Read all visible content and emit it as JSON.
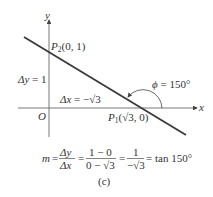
{
  "figure": {
    "caption": "(c)",
    "axes": {
      "x_label": "x",
      "y_label": "y",
      "origin_label": "O"
    },
    "points": {
      "p2": {
        "name": "P",
        "sub": "2",
        "coords": "(0, 1)"
      },
      "p1": {
        "name": "P",
        "sub": "1",
        "coords_prefix": "(",
        "sqrt": "√3",
        "coords_suffix": ", 0)"
      }
    },
    "delta_y": {
      "label": "Δy",
      "eq": " = 1"
    },
    "delta_x": {
      "label": "Δx",
      "eq": " = −",
      "sqrt": "√3"
    },
    "angle": {
      "symbol": "ϕ",
      "eq": " = 150°"
    },
    "formula": {
      "m": "m",
      "eq1": "=",
      "frac1_num": "Δy",
      "frac1_den": "Δx",
      "eq2": "=",
      "frac2_num": "1 − 0",
      "frac2_den": "0 − √3",
      "eq3": "=",
      "frac3_num": "1",
      "frac3_den": "−√3",
      "eq4": "= tan 150°"
    },
    "colors": {
      "line": "#3a3a3a",
      "axis": "#555555",
      "text": "#333333"
    }
  }
}
